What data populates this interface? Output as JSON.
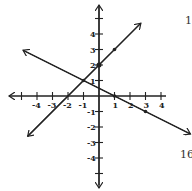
{
  "diagram": {
    "type": "coordinate-plane-graph",
    "axes": {
      "x_ticks": [
        -5,
        -4,
        -3,
        -2,
        -1,
        1,
        2,
        3,
        4
      ],
      "x_labels": [
        "-4",
        "-3",
        "-2",
        "-1",
        "1",
        "2",
        "3",
        "4"
      ],
      "y_ticks": [
        -5,
        -4,
        -3,
        -2,
        -1,
        1,
        2,
        3,
        4,
        5
      ],
      "y_labels": [
        "4",
        "3",
        "2",
        "1",
        "-1",
        "-2",
        "-3",
        "-4"
      ],
      "range": {
        "x": [
          -5,
          4
        ],
        "y": [
          -5,
          5
        ]
      }
    },
    "lines": [
      {
        "name": "line-increasing",
        "equation": "y = x + 2",
        "points": [
          [
            -2,
            0
          ],
          [
            -1,
            1
          ],
          [
            0,
            2
          ],
          [
            1,
            3
          ]
        ],
        "color": "#222222"
      },
      {
        "name": "line-decreasing",
        "equation": "y = -x/2 + 1/2",
        "points": [
          [
            -1,
            1
          ],
          [
            1,
            0
          ],
          [
            3,
            -1
          ]
        ],
        "color": "#222222"
      }
    ],
    "intersection": [
      -1,
      1
    ]
  },
  "edge_text": {
    "top_right": "1",
    "bottom_right": "16"
  }
}
